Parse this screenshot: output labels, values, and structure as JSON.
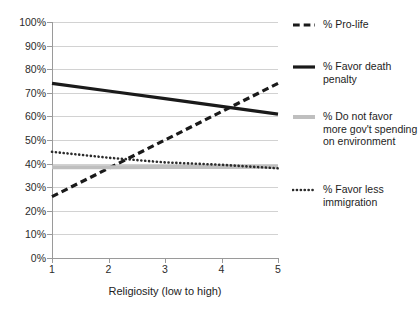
{
  "chart_data": {
    "type": "line",
    "title": "",
    "subtitle": "",
    "xlabel": "Religiosity (low to high)",
    "ylabel": "",
    "x": [
      1,
      2,
      3,
      4,
      5
    ],
    "xlim": [
      1,
      5
    ],
    "ylim": [
      0,
      100
    ],
    "y_tick_labels": [
      "0%",
      "10%",
      "20%",
      "30%",
      "40%",
      "50%",
      "60%",
      "70%",
      "80%",
      "90%",
      "100%"
    ],
    "y_tick_values": [
      0,
      10,
      20,
      30,
      40,
      50,
      60,
      70,
      80,
      90,
      100
    ],
    "x_tick_labels": [
      "1",
      "2",
      "3",
      "4",
      "5"
    ],
    "grid": "horizontal",
    "legend_position": "right",
    "series": [
      {
        "name": "% Pro-life",
        "style": "dashed",
        "color": "#1a1a1a",
        "width": 3.2,
        "values": [
          26,
          38,
          50,
          62,
          74
        ]
      },
      {
        "name": "% Favor death penalty",
        "style": "solid",
        "color": "#1a1a1a",
        "width": 3.2,
        "values": [
          74,
          70.75,
          67.5,
          64.25,
          61
        ]
      },
      {
        "name": "% Do not favor more gov't spending on environment",
        "style": "solid",
        "color": "#bfbfbf",
        "width": 4.0,
        "values": [
          38.5,
          38.5,
          38.6,
          38.6,
          38.7
        ]
      },
      {
        "name": "% Favor less immigration",
        "style": "dotted",
        "color": "#2b2b2b",
        "width": 2.6,
        "values": [
          45,
          42.5,
          40.5,
          39.5,
          38
        ]
      }
    ]
  },
  "legend": {
    "items": [
      {
        "label": "% Pro-life",
        "marker": "dashed-line-marker"
      },
      {
        "label": "% Favor death penalty",
        "marker": "solid-line-marker"
      },
      {
        "label": "% Do not favor more gov't spending on environment",
        "marker": "gray-line-marker"
      },
      {
        "label": "% Favor less immigration",
        "marker": "dotted-line-marker"
      }
    ]
  },
  "axes": {
    "x_title": "Religiosity (low to high)"
  }
}
